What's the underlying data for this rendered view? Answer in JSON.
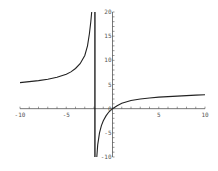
{
  "chart_data": {
    "type": "line",
    "title": "",
    "xlabel": "",
    "ylabel": "",
    "xlim": [
      -10,
      10
    ],
    "ylim": [
      -10,
      20
    ],
    "grid": false,
    "x_ticks": [
      "-10",
      "-5",
      "5",
      "10"
    ],
    "y_ticks": [
      "20",
      "15",
      "10",
      "5",
      "0",
      "-5",
      "-10"
    ],
    "vertical_asymptote_x": -1.9,
    "series": [
      {
        "name": "left branch",
        "x": [
          -10,
          -9,
          -8,
          -7,
          -6,
          -5,
          -4.5,
          -4,
          -3.5,
          -3,
          -2.7,
          -2.5,
          -2.35,
          -2.25
        ],
        "y": [
          5.4,
          5.6,
          5.8,
          6.1,
          6.5,
          7.1,
          7.6,
          8.3,
          9.3,
          11.0,
          13.0,
          15.5,
          18.0,
          20.0
        ]
      },
      {
        "name": "right branch",
        "x": [
          -1.7,
          -1.6,
          -1.4,
          -1.2,
          -1.0,
          -0.7,
          -0.4,
          0,
          0.5,
          1,
          2,
          3,
          4,
          5,
          6,
          7,
          8,
          9,
          10
        ],
        "y": [
          -10.0,
          -7.5,
          -5.0,
          -3.5,
          -2.5,
          -1.5,
          -0.7,
          0,
          0.6,
          1.1,
          1.7,
          2.0,
          2.2,
          2.4,
          2.5,
          2.6,
          2.7,
          2.8,
          2.9
        ]
      }
    ]
  },
  "colors": {
    "curve": "#222222",
    "axis": "#555555",
    "asymptote": "#111111"
  }
}
